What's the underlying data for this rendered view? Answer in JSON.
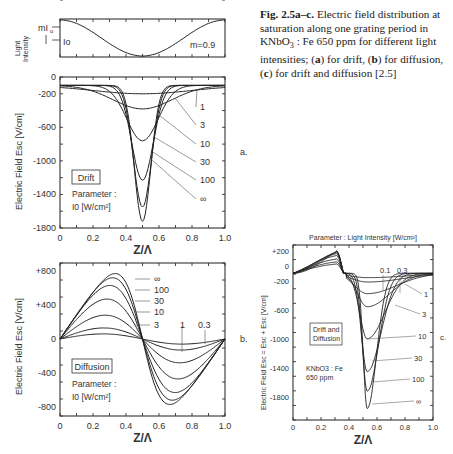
{
  "caption": {
    "label": "Fig. 2.5a–c.",
    "text": " Electric field distribution at saturation along one grating period in KNbO",
    "sub": "3",
    "text2": " : Fe 650 ppm for different light intensities; (",
    "a": "a",
    "t_a": ") for drift, (",
    "b": "b",
    "t_b": ") for diffusion, (",
    "c": "c",
    "t_c": ") for drift and diffusion [2.5]"
  },
  "chart_data": [
    {
      "id": "intensity",
      "type": "line",
      "title": "",
      "ylabel": "Light Intensity",
      "annotations": [
        "mI0",
        "I0",
        "m = 0.9"
      ],
      "x": [
        0,
        0.1,
        0.2,
        0.3,
        0.4,
        0.5,
        0.6,
        0.7,
        0.8,
        0.9,
        1.0
      ],
      "series": [
        {
          "name": "I(z)",
          "values": [
            1.9,
            1.855,
            1.727,
            1.529,
            1.278,
            1.0,
            0.722,
            0.471,
            0.273,
            0.145,
            0.1
          ]
        }
      ],
      "xlim": [
        0,
        1
      ],
      "ylim": [
        0.1,
        1.9
      ]
    },
    {
      "id": "a",
      "panel_label": "a.",
      "type": "line",
      "title": "",
      "xlabel": "Z/Λ",
      "ylabel": "Electric Field E_sc^d [V/cm]",
      "box_label": "Drift",
      "parameter_label": "Parameter :",
      "parameter_unit": "I0 [W/cm²]",
      "xlim": [
        0,
        1.0
      ],
      "ylim": [
        -1800,
        0
      ],
      "xticks": [
        "0",
        "0.2",
        "0.4",
        "0.6",
        "0.8",
        "1.0"
      ],
      "yticks": [
        "0",
        "-200",
        "-600",
        "-1000",
        "-1400",
        "-1800"
      ],
      "series": [
        {
          "name": "1",
          "min": -200,
          "width": 0.3
        },
        {
          "name": "3",
          "min": -380,
          "width": 0.18
        },
        {
          "name": "10",
          "min": -760,
          "width": 0.095
        },
        {
          "name": "30",
          "min": -1230,
          "width": 0.065
        },
        {
          "name": "100",
          "min": -1550,
          "width": 0.055
        },
        {
          "name": "∞",
          "min": -1720,
          "width": 0.05
        }
      ],
      "baseline": -100
    },
    {
      "id": "b",
      "panel_label": "b.",
      "type": "line",
      "title": "",
      "xlabel": "Z/Λ",
      "ylabel": "Electric Field E_sc^D [V/cm]",
      "box_label": "Diffusion",
      "parameter_label": "Parameter :",
      "parameter_unit": "I0 [W/cm²]",
      "xlim": [
        0,
        1.0
      ],
      "ylim": [
        -900,
        900
      ],
      "xticks": [
        "0",
        "0.2",
        "0.4",
        "0.6",
        "0.8",
        "1.0"
      ],
      "yticks": [
        "+800",
        "+400",
        "0",
        "-400",
        "-800"
      ],
      "series": [
        {
          "name": "0.3",
          "peak": 60,
          "sharp": 1.0
        },
        {
          "name": "1",
          "peak": 130,
          "sharp": 1.5
        },
        {
          "name": "3",
          "peak": 280,
          "sharp": 2.5
        },
        {
          "name": "10",
          "peak": 470,
          "sharp": 4
        },
        {
          "name": "30",
          "peak": 630,
          "sharp": 7
        },
        {
          "name": "100",
          "peak": 720,
          "sharp": 11
        },
        {
          "name": "∞",
          "peak": 770,
          "sharp": 16
        }
      ]
    },
    {
      "id": "c",
      "panel_label": "c.",
      "type": "line",
      "title": "Parameter : Light Intensity  [W/cm²]",
      "xlabel": "Z/Λ",
      "ylabel": "Electric Field E_sc = E_sc^d + E_sc^D [V/cm]",
      "box_label": [
        "Drift and",
        "Diffusion"
      ],
      "material_label": [
        "KNbO3 : Fe",
        "650 ppm"
      ],
      "xlim": [
        0,
        1.0
      ],
      "ylim": [
        -2100,
        300
      ],
      "xticks": [
        "0",
        "0.2",
        "0.4",
        "0.6",
        "0.8",
        "1.0"
      ],
      "yticks": [
        "+200",
        "0",
        "-200",
        "-600",
        "-1000",
        "-1400",
        "-1800"
      ],
      "series": [
        {
          "name": "0.1",
          "peak": 30,
          "min": -160,
          "sharp": 1.0
        },
        {
          "name": "0.3",
          "peak": 60,
          "min": -220,
          "sharp": 1.2
        },
        {
          "name": "1",
          "peak": 100,
          "min": -380,
          "sharp": 1.8
        },
        {
          "name": "3",
          "peak": 150,
          "min": -560,
          "sharp": 3
        },
        {
          "name": "10",
          "peak": 180,
          "min": -1000,
          "sharp": 5
        },
        {
          "name": "30",
          "peak": 200,
          "min": -1450,
          "sharp": 8
        },
        {
          "name": "100",
          "peak": 210,
          "min": -1720,
          "sharp": 12
        },
        {
          "name": "∞",
          "peak": 215,
          "min": -1960,
          "sharp": 18
        }
      ]
    }
  ]
}
